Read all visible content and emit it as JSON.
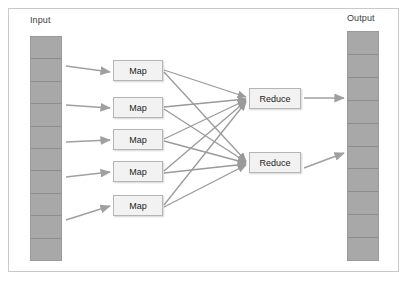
{
  "diagram": {
    "frame": {
      "stroke": "#c9c9c9"
    },
    "colors": {
      "cell_fill": "#a8a8a8",
      "cell_stroke": "#8d8d8d",
      "node_fill": "#f2f2f2",
      "node_stroke": "#b5b5b5",
      "arrow": "#a0a0a0",
      "edge": "#9a9a9a",
      "label_text": "#404040",
      "node_text": "#222222"
    },
    "input": {
      "label": "Input",
      "cell_count": 10,
      "cells": [
        "",
        "",
        "",
        "",
        "",
        "",
        "",
        "",
        "",
        ""
      ]
    },
    "output": {
      "label": "Output",
      "cell_count": 10,
      "cells": [
        "",
        "",
        "",
        "",
        "",
        "",
        "",
        "",
        "",
        ""
      ]
    },
    "map_nodes": [
      {
        "label": "Map"
      },
      {
        "label": "Map"
      },
      {
        "label": "Map"
      },
      {
        "label": "Map"
      },
      {
        "label": "Map"
      }
    ],
    "reduce_nodes": [
      {
        "label": "Reduce"
      },
      {
        "label": "Reduce"
      }
    ],
    "edges": {
      "input_to_map_count": 5,
      "map_to_reduce_count": 10,
      "reduce_to_output_count": 2
    }
  }
}
